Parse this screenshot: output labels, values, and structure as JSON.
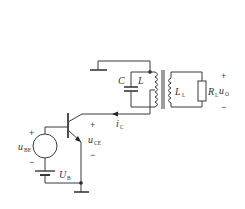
{
  "diagram": {
    "type": "circuit-schematic",
    "components": [
      {
        "id": "C",
        "kind": "capacitor",
        "label": "C"
      },
      {
        "id": "L",
        "kind": "inductor",
        "label": "L"
      },
      {
        "id": "LL",
        "kind": "inductor",
        "label": "L",
        "sub": "L"
      },
      {
        "id": "RL",
        "kind": "resistor",
        "label": "R",
        "sub": "L"
      },
      {
        "id": "Q",
        "kind": "npn-transistor"
      },
      {
        "id": "uBE",
        "kind": "voltage-source",
        "label": "u",
        "sub": "BE"
      },
      {
        "id": "UB",
        "kind": "battery",
        "label": "U",
        "sub": "B"
      }
    ],
    "labels": {
      "C": "C",
      "L": "L",
      "LL_main": "L",
      "LL_sub": "L",
      "RL_main": "R",
      "RL_sub": "L",
      "uO_main": "u",
      "uO_sub": "O",
      "uO_plus": "+",
      "uO_minus": "−",
      "iC_main": "i",
      "iC_sub": "C",
      "uCE_main": "u",
      "uCE_sub": "CE",
      "uCE_plus": "+",
      "uCE_minus": "−",
      "uBE_main": "u",
      "uBE_sub": "BE",
      "uBE_plus": "+",
      "uBE_minus": "−",
      "UB_main": "U",
      "UB_sub": "B"
    },
    "colors": {
      "wire": "#3a3a3a",
      "background": "#ffffff"
    }
  }
}
